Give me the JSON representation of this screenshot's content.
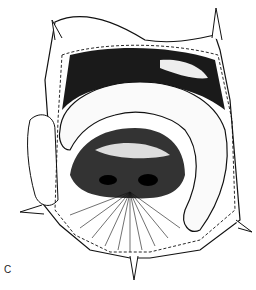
{
  "figure": {
    "panel_label": "C"
  },
  "colors": {
    "ink": "#111111",
    "background": "#ffffff"
  }
}
